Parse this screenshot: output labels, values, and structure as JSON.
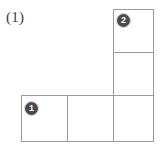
{
  "figure": {
    "problem_label": "(1)",
    "shape_name": "L-shaped grid of six unit squares",
    "line_color": "#9a9a9a",
    "background_color": "#ffffff",
    "marker_fill_color": "#4a4a4a",
    "marker_text_color": "#ffffff",
    "label_color": "#3b3b3b",
    "cells": [
      {
        "id": "cell-r0c2",
        "row": 0,
        "col": 2,
        "x": 113,
        "y": 9,
        "w": 41,
        "h": 44,
        "marker": "2"
      },
      {
        "id": "cell-r1c2",
        "row": 1,
        "col": 2,
        "x": 113,
        "y": 53,
        "w": 41,
        "h": 43,
        "marker": ""
      },
      {
        "id": "cell-r2c0",
        "row": 2,
        "col": 0,
        "x": 21,
        "y": 96,
        "w": 46,
        "h": 46,
        "marker": "1"
      },
      {
        "id": "cell-r2c1",
        "row": 2,
        "col": 1,
        "x": 67,
        "y": 96,
        "w": 46,
        "h": 46,
        "marker": ""
      },
      {
        "id": "cell-r2c2",
        "row": 2,
        "col": 2,
        "x": 113,
        "y": 96,
        "w": 41,
        "h": 46,
        "marker": ""
      }
    ],
    "markers": [
      {
        "id": "marker-one",
        "label": "1",
        "x": 25,
        "y": 102,
        "cell": "cell-r2c0"
      },
      {
        "id": "marker-two",
        "label": "2",
        "x": 117,
        "y": 14,
        "cell": "cell-r0c2"
      }
    ]
  }
}
